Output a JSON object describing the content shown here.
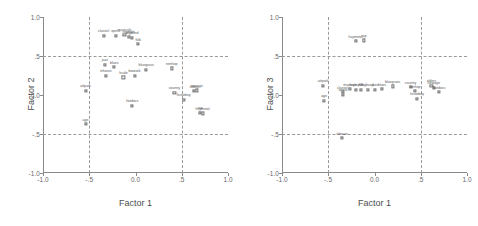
{
  "figure": {
    "title": "",
    "panels": [
      {
        "id": "factor1-factor2",
        "xlabel": "Factor 1",
        "ylabel": "Factor 2"
      },
      {
        "id": "factor1-factor3",
        "xlabel": "Factor 1",
        "ylabel": "Factor 3"
      }
    ],
    "tick_labels_x": [
      "-1.0",
      "-.5",
      "0.0",
      ".5",
      "1.0"
    ],
    "tick_labels_y": [
      "1.0",
      ".5",
      "0.0",
      "-.5",
      "-1.0"
    ]
  },
  "chart_data": [
    {
      "type": "scatter",
      "title": "",
      "xlabel": "Factor 1",
      "ylabel": "Factor 2",
      "xlim": [
        -1.0,
        1.0
      ],
      "ylim": [
        -1.0,
        1.0
      ],
      "xticks": [
        -1.0,
        -0.5,
        0.0,
        0.5,
        1.0
      ],
      "yticks": [
        -1.0,
        -0.5,
        0.0,
        0.5,
        1.0
      ],
      "xticklabels": [
        "-1.0",
        "-.5",
        "0.0",
        ".5",
        "1.0"
      ],
      "yticklabels": [
        "-1.0",
        "-.5",
        "0.0",
        ".5",
        "1.0"
      ],
      "grid": true,
      "gridlines_x": [
        -0.5,
        0.5
      ],
      "gridlines_y": [
        -0.5,
        0.5
      ],
      "legend": "none",
      "points": [
        {
          "label": "classicl",
          "x": -0.345,
          "y": 0.76
        },
        {
          "labeA": "",
          "label": "opera",
          "x": -0.215,
          "y": 0.762
        },
        {
          "label": "musicals",
          "x": -0.12,
          "y": 0.775
        },
        {
          "label": "hsymph",
          "x": -0.075,
          "y": 0.745
        },
        {
          "label": "bigband",
          "x": -0.035,
          "y": 0.735
        },
        {
          "label": "folk",
          "x": 0.03,
          "y": 0.65
        },
        {
          "label": "jazz",
          "x": -0.33,
          "y": 0.385
        },
        {
          "label": "blues",
          "x": -0.23,
          "y": 0.355
        },
        {
          "label": "tvhours",
          "x": -0.32,
          "y": 0.245
        },
        {
          "label": "hcafe",
          "x": -0.13,
          "y": 0.225
        },
        {
          "label": "bwwork",
          "x": -0.01,
          "y": 0.25
        },
        {
          "label": "bluegrass",
          "x": 0.115,
          "y": 0.32
        },
        {
          "label": "reinhop",
          "x": 0.39,
          "y": 0.34
        },
        {
          "label": "attpark",
          "x": -0.54,
          "y": 0.055
        },
        {
          "label": "country",
          "x": 0.42,
          "y": 0.03
        },
        {
          "label": "oldies",
          "x": 0.635,
          "y": 0.05
        },
        {
          "label": "newage",
          "x": 0.66,
          "y": 0.06
        },
        {
          "label": "hcowboy",
          "x": 0.52,
          "y": -0.06
        },
        {
          "label": "hotdocs",
          "x": -0.035,
          "y": -0.135
        },
        {
          "label": "rap",
          "x": 0.7,
          "y": -0.23
        },
        {
          "label": "hvymetal",
          "x": 0.725,
          "y": -0.235
        },
        {
          "label": "age",
          "x": -0.54,
          "y": -0.375
        }
      ]
    },
    {
      "type": "scatter",
      "title": "",
      "xlabel": "Factor 1",
      "ylabel": "Factor 3",
      "xlim": [
        -1.0,
        1.0
      ],
      "ylim": [
        -1.0,
        1.0
      ],
      "xticks": [
        -1.0,
        -0.5,
        0.0,
        0.5,
        1.0
      ],
      "yticks": [
        -1.0,
        -0.5,
        0.0,
        0.5,
        1.0
      ],
      "xticklabels": [
        "-1.0",
        "-.5",
        "0.0",
        ".5",
        "1.0"
      ],
      "yticklabels": [
        "-1.0",
        "-.5",
        "0.0",
        ".5",
        "1.0"
      ],
      "grid": true,
      "gridlines_x": [
        -0.5,
        0.5
      ],
      "gridlines_y": [
        -0.5,
        0.5
      ],
      "legend": "none",
      "points": [
        {
          "label": "hvymetal",
          "x": -0.205,
          "y": 0.69
        },
        {
          "label": "rap",
          "x": -0.115,
          "y": 0.7
        },
        {
          "label": "attpark",
          "x": -0.555,
          "y": 0.12
        },
        {
          "label": "age",
          "x": -0.545,
          "y": -0.075
        },
        {
          "label": "classicl",
          "x": -0.345,
          "y": 0.035
        },
        {
          "label": "opera",
          "x": -0.34,
          "y": 0.005
        },
        {
          "label": "musicals",
          "x": -0.265,
          "y": 0.075
        },
        {
          "label": "hsymph",
          "x": -0.205,
          "y": 0.07
        },
        {
          "label": "folk",
          "x": -0.145,
          "y": 0.07
        },
        {
          "label": "bigband",
          "x": -0.075,
          "y": 0.065
        },
        {
          "label": "jazz",
          "x": 0.005,
          "y": 0.07
        },
        {
          "label": "blues",
          "x": 0.08,
          "y": 0.075
        },
        {
          "label": "bluegrass",
          "x": 0.195,
          "y": 0.11
        },
        {
          "label": "country",
          "x": 0.39,
          "y": 0.1
        },
        {
          "label": "reinhop",
          "x": 0.435,
          "y": 0.05
        },
        {
          "label": "hcowboy",
          "x": 0.46,
          "y": -0.045
        },
        {
          "label": "oldies",
          "x": 0.615,
          "y": 0.12
        },
        {
          "label": "newage",
          "x": 0.64,
          "y": 0.095
        },
        {
          "label": "hotdocs",
          "x": 0.7,
          "y": 0.035
        },
        {
          "label": "tvhours",
          "x": -0.35,
          "y": -0.555
        }
      ]
    }
  ]
}
